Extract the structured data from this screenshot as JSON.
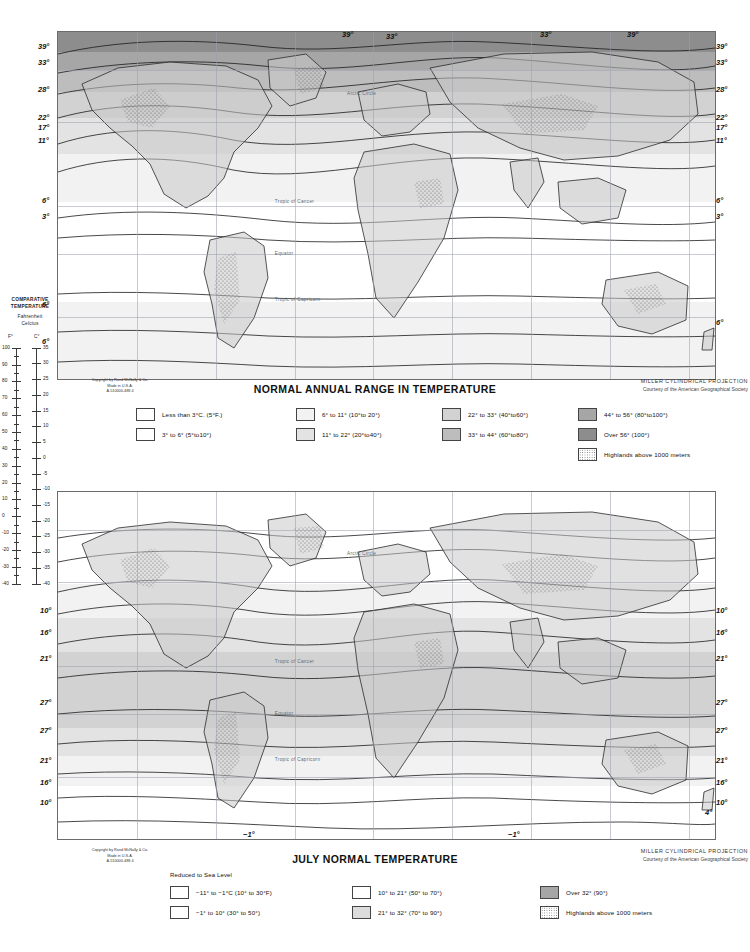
{
  "page": {
    "publisher_credit": "Copyright by Rand MᴄNally & Co.\nMade in U.S.A.\nA-510000-488        4"
  },
  "comparative_scale": {
    "title_line1": "COMPARATIVE",
    "title_line2": "TEMPERATURE",
    "line3": "Fahrenheit",
    "line4": "Celcius",
    "unit_f": "F°",
    "unit_c": "C°",
    "fahrenheit_ticks": [
      100,
      90,
      80,
      70,
      60,
      50,
      40,
      30,
      20,
      10,
      0,
      -10,
      -20,
      -30,
      -40
    ],
    "celsius_ticks": [
      35,
      30,
      25,
      20,
      15,
      10,
      5,
      0,
      -5,
      -10,
      -15,
      -20,
      -25,
      -30,
      -35,
      -40
    ]
  },
  "maps": [
    {
      "id": "normal-annual-range",
      "title": "NORMAL ANNUAL RANGE IN TEMPERATURE",
      "projection_line1": "MILLER CYLINDRICAL PROJECTION",
      "projection_line2": "Courtesy of the American Geographical Society",
      "edge_labels_left": [
        "39°",
        "33°",
        "28°",
        "22°",
        "17°",
        "11°",
        "6°",
        "3°",
        "6°",
        "6°"
      ],
      "edge_labels_right": [
        "39°",
        "33°",
        "28°",
        "22°",
        "17°",
        "11°",
        "6°",
        "3°",
        "6°"
      ],
      "interior_labels": [
        "39°",
        "33°",
        "33°",
        "39°"
      ],
      "geo_labels": [
        "Arctic Circle",
        "Tropic of Cancer",
        "Equator",
        "Tropic of Capricorn"
      ],
      "legend": {
        "note": "",
        "columns": [
          [
            {
              "swatch": "#ffffff",
              "pattern": "solid",
              "text": "Less than 3°C.  (5°F.)"
            },
            {
              "swatch": "#ffffff",
              "pattern": "solid",
              "text": "3° to 6°   (5°to10°)"
            }
          ],
          [
            {
              "swatch": "#f2f2f2",
              "pattern": "solid",
              "text": "6° to 11°   (10°to 20°)"
            },
            {
              "swatch": "#e3e3e3",
              "pattern": "solid",
              "text": "11° to 22°   (20°to40°)"
            }
          ],
          [
            {
              "swatch": "#d2d2d2",
              "pattern": "solid",
              "text": "22° to 33°   (40°to60°)"
            },
            {
              "swatch": "#bdbdbd",
              "pattern": "solid",
              "text": "33° to 44°   (60°to80°)"
            }
          ],
          [
            {
              "swatch": "#a6a6a6",
              "pattern": "solid",
              "text": "44° to 56°   (80°to100°)"
            },
            {
              "swatch": "#8d8d8d",
              "pattern": "solid",
              "text": "Over 56°    (100°)"
            },
            {
              "swatch": "#ffffff",
              "pattern": "stipple",
              "text": "Highlands above 1000 meters"
            }
          ]
        ]
      }
    },
    {
      "id": "july-normal-temperature",
      "title": "JULY NORMAL TEMPERATURE",
      "projection_line1": "MILLER CYLINDRICAL PROJECTION",
      "projection_line2": "Courtesy of the American Geographical Society",
      "edge_labels_left": [
        "10°",
        "16°",
        "21°",
        "27°",
        "27°",
        "21°",
        "16°",
        "10°"
      ],
      "edge_labels_right": [
        "10°",
        "16°",
        "21°",
        "27°",
        "27°",
        "21°",
        "16°",
        "10°"
      ],
      "interior_labels": [
        "−1°",
        "−1°",
        "4°"
      ],
      "geo_labels": [
        "Arctic Circle",
        "Tropic of Cancer",
        "Equator",
        "Tropic of Capricorn"
      ],
      "legend": {
        "note": "Reduced to Sea Level",
        "columns": [
          [
            {
              "swatch": "#ffffff",
              "pattern": "solid",
              "text": "−11° to −1°C   (10° to 30°F)"
            },
            {
              "swatch": "#ffffff",
              "pattern": "solid",
              "text": "−1° to 10°   (30° to 50°)"
            }
          ],
          [
            {
              "swatch": "#ffffff",
              "pattern": "solid",
              "text": "10° to 21°   (50° to 70°)"
            },
            {
              "swatch": "#dcdcdc",
              "pattern": "solid",
              "text": "21° to 32°   (70° to 90°)"
            }
          ],
          [
            {
              "swatch": "#a6a6a6",
              "pattern": "solid",
              "text": "Over 32°   (90°)"
            },
            {
              "swatch": "#ffffff",
              "pattern": "stipple",
              "text": "Highlands above 1000 meters"
            }
          ]
        ]
      }
    }
  ]
}
